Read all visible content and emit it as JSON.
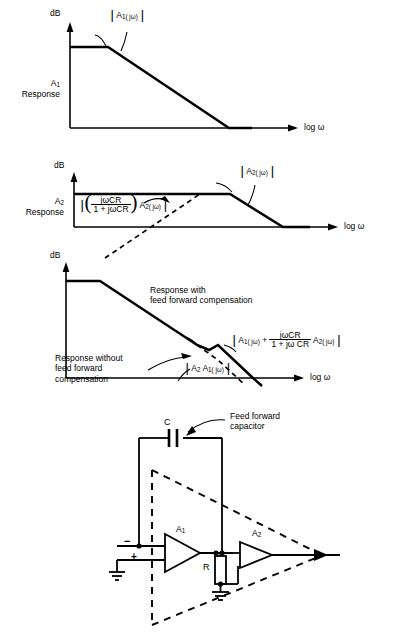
{
  "figure": {
    "axis_y_label": "dB",
    "axis_x_label": "log ω"
  },
  "charts": [
    {
      "name": "a1-response",
      "side_label_line1": "A",
      "side_label_sub": "1",
      "side_label_line2": "Response",
      "y_axis": "dB",
      "x_axis": "log ω",
      "curve_label": {
        "prefix": "A",
        "sub": "1",
        "arg": "( jω)"
      }
    },
    {
      "name": "a2-response",
      "side_label_line1": "A",
      "side_label_sub": "2",
      "side_label_line2": "Response",
      "y_axis": "dB",
      "x_axis": "log ω",
      "curve_label": {
        "prefix": "A",
        "sub": "2",
        "arg": "( jω)"
      },
      "dashed_label": {
        "numerator": "jωCR",
        "denominator": "1 + jωCR",
        "factor_prefix": "A",
        "factor_sub": "2",
        "factor_arg": "( jω)"
      }
    },
    {
      "name": "combined-response",
      "y_axis": "dB",
      "x_axis": "log ω",
      "note_with": "Response with\nfeed forward compensation",
      "note_with_line1": "Response with",
      "note_with_line2": "feed forward compensation",
      "note_without_line1": "Response without",
      "note_without_line2": "feed forward",
      "note_without_line3": "compensation",
      "combined_label": {
        "term1_prefix": "A",
        "term1_sub": "1",
        "term1_arg": "( jω)",
        "plus": "+",
        "numerator": "jωCR",
        "denominator": "1 + jω CR",
        "term2_prefix": "A",
        "term2_sub": "2",
        "term2_arg": "( jω)"
      },
      "uncomp_label": {
        "a2": "A",
        "a2_sub": "2",
        "a1": "A",
        "a1_sub": "1",
        "arg": "( jω)"
      }
    }
  ],
  "circuit": {
    "capacitor_designator": "C",
    "capacitor_note_line1": "Feed forward",
    "capacitor_note_line2": "capacitor",
    "stage1_label": "A",
    "stage1_sub": "1",
    "stage2_label": "A",
    "stage2_sub": "2",
    "resistor_designator": "R",
    "minus_input": "−",
    "plus_input": "+"
  },
  "colors": {
    "ink": "#000000",
    "paper": "#ffffff"
  }
}
